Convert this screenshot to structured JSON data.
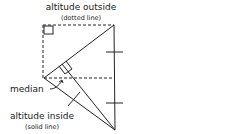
{
  "labels": {
    "altitude_outside": "altitude outside",
    "altitude_outside_note": "(dotted line)",
    "median": "median",
    "altitude_inside": "altitude inside",
    "altitude_inside_note": "(solid line)"
  },
  "colors": {
    "stroke": "#222222",
    "background": "#ffffff"
  }
}
